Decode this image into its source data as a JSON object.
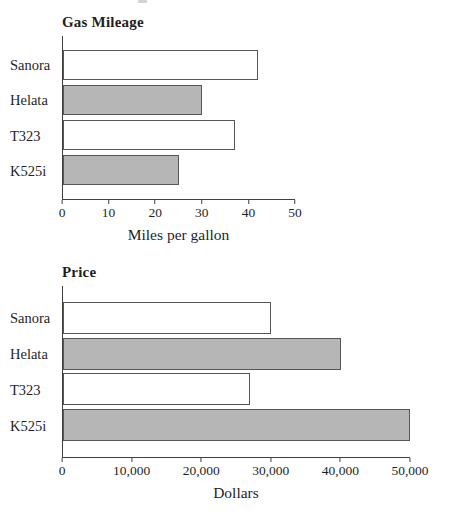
{
  "page": {
    "background": "#ffffff"
  },
  "colors": {
    "bar_gray": "#b6b6b6",
    "bar_white": "#ffffff",
    "bar_border": "#565656",
    "axis": "#3f3f3f",
    "text": "#1f1f1f"
  },
  "chart_data": [
    {
      "type": "bar",
      "orientation": "horizontal",
      "title": "Gas Mileage",
      "categories": [
        "Sanora",
        "Helata",
        "T323",
        "K525i"
      ],
      "values": [
        42,
        30,
        37,
        25
      ],
      "xlabel": "Miles per gallon",
      "xlim": [
        0,
        50
      ],
      "tick_labels": [
        "0",
        "10",
        "20",
        "30",
        "40",
        "50"
      ],
      "bar_fills": [
        "white",
        "gray",
        "white",
        "gray"
      ],
      "grid": false,
      "legend": false
    },
    {
      "type": "bar",
      "orientation": "horizontal",
      "title": "Price",
      "categories": [
        "Sanora",
        "Helata",
        "T323",
        "K525i"
      ],
      "values": [
        30000,
        40000,
        27000,
        50000
      ],
      "xlabel": "Dollars",
      "xlim": [
        0,
        50000
      ],
      "tick_labels": [
        "0",
        "10,000",
        "20,000",
        "30,000",
        "40,000",
        "50,000"
      ],
      "bar_fills": [
        "white",
        "gray",
        "white",
        "gray"
      ],
      "grid": false,
      "legend": false
    }
  ]
}
